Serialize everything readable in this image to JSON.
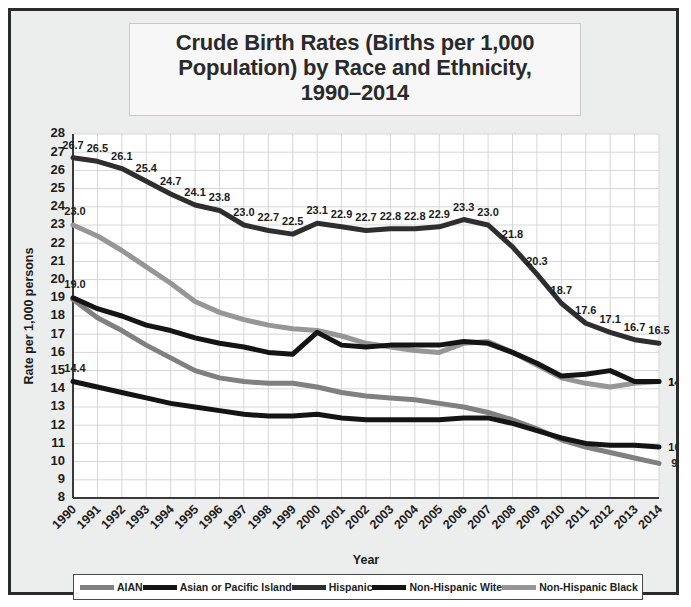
{
  "title": {
    "lines": [
      "Crude Birth Rates (Births per 1,000",
      "Population) by Race and Ethnicity,",
      "1990–2014"
    ]
  },
  "legend": {
    "items": [
      {
        "label": "AIAN",
        "color": "#808080"
      },
      {
        "label": "Asian or Pacific Island",
        "color": "#141414"
      },
      {
        "label": "Hispanic",
        "color": "#2e2e2e"
      },
      {
        "label": "Non-Hispanic Wite",
        "color": "#141414"
      },
      {
        "label": "Non-Hispanic Black",
        "color": "#969696"
      }
    ]
  },
  "chart_data": {
    "type": "line",
    "title": "Crude Birth Rates (Births per 1,000 Population) by Race and Ethnicity, 1990–2014",
    "xlabel": "Year",
    "ylabel": "Rate per 1,000 persons",
    "ylim": [
      8,
      28
    ],
    "yticks": [
      8,
      9,
      10,
      11,
      12,
      13,
      14,
      15,
      16,
      17,
      18,
      19,
      20,
      21,
      22,
      23,
      24,
      25,
      26,
      27,
      28
    ],
    "grid": true,
    "legend_position": "bottom",
    "categories": [
      "1990",
      "1991",
      "1992",
      "1993",
      "1994",
      "1995",
      "1996",
      "1997",
      "1998",
      "1999",
      "2000",
      "2001",
      "2002",
      "2003",
      "2004",
      "2005",
      "2006",
      "2007",
      "2008",
      "2009",
      "2010",
      "2011",
      "2012",
      "2013",
      "2014"
    ],
    "series": [
      {
        "name": "Hispanic",
        "color": "#2e2e2e",
        "width": 5,
        "labeled": true,
        "values": [
          26.7,
          26.5,
          26.1,
          25.4,
          24.7,
          24.1,
          23.8,
          23.0,
          22.7,
          22.5,
          23.1,
          22.9,
          22.7,
          22.8,
          22.8,
          22.9,
          23.3,
          23.0,
          21.8,
          20.3,
          18.7,
          17.6,
          17.1,
          16.7,
          16.5
        ],
        "labels": [
          "26.7",
          "26.5",
          "26.1",
          "25.4",
          "24.7",
          "24.1",
          "23.8",
          "23.0",
          "22.7",
          "22.5",
          "23.1",
          "22.9",
          "22.7",
          "22.8",
          "22.8",
          "22.9",
          "23.3",
          "23.0",
          "21.8",
          "20.3",
          "18.7",
          "17.6",
          "17.1",
          "16.7",
          "16.5"
        ]
      },
      {
        "name": "Non-Hispanic Black",
        "color": "#969696",
        "width": 5,
        "labeled": false,
        "endpoint_labels": {
          "first": "23.0",
          "last": "14.4"
        },
        "values": [
          23.0,
          22.4,
          21.6,
          20.7,
          19.8,
          18.8,
          18.2,
          17.8,
          17.5,
          17.3,
          17.2,
          16.9,
          16.5,
          16.3,
          16.1,
          16.0,
          16.5,
          16.6,
          16.0,
          15.3,
          14.6,
          14.3,
          14.1,
          14.3,
          14.4
        ],
        "labels": []
      },
      {
        "name": "Asian or Pacific Island",
        "color": "#141414",
        "width": 5,
        "labeled": false,
        "endpoint_labels": {
          "first": "19.0",
          "last": "14.4"
        },
        "values": [
          19.0,
          18.4,
          18.0,
          17.5,
          17.2,
          16.8,
          16.5,
          16.3,
          16.0,
          15.9,
          17.1,
          16.4,
          16.3,
          16.4,
          16.4,
          16.4,
          16.6,
          16.5,
          16.0,
          15.4,
          14.7,
          14.8,
          15.0,
          14.4,
          14.4
        ],
        "labels": []
      },
      {
        "name": "AIAN",
        "color": "#808080",
        "width": 5,
        "labeled": false,
        "endpoint_labels": {
          "first": "",
          "last": "9.9"
        },
        "values": [
          18.9,
          17.9,
          17.2,
          16.4,
          15.7,
          15.0,
          14.6,
          14.4,
          14.3,
          14.3,
          14.1,
          13.8,
          13.6,
          13.5,
          13.4,
          13.2,
          13.0,
          12.7,
          12.3,
          11.8,
          11.2,
          10.8,
          10.5,
          10.2,
          9.9
        ],
        "labels": []
      },
      {
        "name": "Non-Hispanic Wite",
        "color": "#141414",
        "width": 5,
        "labeled": false,
        "endpoint_labels": {
          "first": "14.4",
          "last": "10.8"
        },
        "values": [
          14.4,
          14.1,
          13.8,
          13.5,
          13.2,
          13.0,
          12.8,
          12.6,
          12.5,
          12.5,
          12.6,
          12.4,
          12.3,
          12.3,
          12.3,
          12.3,
          12.4,
          12.4,
          12.1,
          11.7,
          11.3,
          11.0,
          10.9,
          10.9,
          10.8
        ],
        "labels": []
      }
    ]
  }
}
